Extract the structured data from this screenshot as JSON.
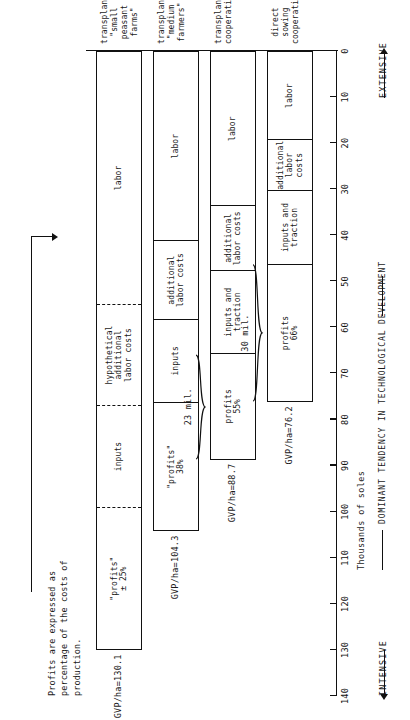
{
  "figure": {
    "note": "Profits are expressed as\npercentage of the costs of\nproduction.",
    "value_axis_title": "Thousands of soles",
    "dominant_tendency_label": "DOMINANT TENDENCY IN TECHNOLOGICAL DEVELOPMENT",
    "intensive_label": "INTENSIVE",
    "extensive_label": "EXTENSIVE"
  },
  "chart_data": {
    "type": "bar",
    "orientation": "horizontal-stacked-rotated",
    "title": "",
    "xlabel": "Thousands of soles",
    "ylabel": "",
    "xlim": [
      0,
      140
    ],
    "grid": false,
    "legend": "none",
    "ticks": [
      140,
      130,
      120,
      110,
      100,
      90,
      80,
      70,
      60,
      50,
      40,
      30,
      20,
      10,
      0
    ],
    "categories": [
      "transplanting\n\"small peasant\nfarms\"",
      "transplanting\n\"medium farmers\"",
      "transplanting\ncooperatives",
      "direct sowing\ncooperatives"
    ],
    "bars": [
      {
        "gvp_label": "GVP/ha=130.1",
        "total": 130.1,
        "category": "transplanting\n\"small peasant\nfarms\"",
        "dashed_dividers": true,
        "segments": [
          {
            "label": "\"profits\"",
            "pct": "± 25%",
            "value": 31.0
          },
          {
            "label": "inputs",
            "pct": "",
            "value": 22.0
          },
          {
            "label": "hypothetical\nadditional\nlabor costs",
            "pct": "",
            "value": 22.0
          },
          {
            "label": "labor",
            "pct": "",
            "value": 55.1
          }
        ]
      },
      {
        "gvp_label": "GVP/ha=104.3",
        "total": 104.3,
        "category": "transplanting\n\"medium farmers\"",
        "dashed_dividers": false,
        "segments": [
          {
            "label": "\"profits\"",
            "pct": "38%",
            "value": 28.0
          },
          {
            "label": "inputs",
            "pct": "",
            "value": 18.0
          },
          {
            "label": "additional\nlabor costs",
            "pct": "",
            "value": 17.0
          },
          {
            "label": "labor",
            "pct": "",
            "value": 41.3
          }
        ]
      },
      {
        "gvp_label": "GVP/ha=88.7",
        "total": 88.7,
        "category": "transplanting\ncooperatives",
        "dashed_dividers": false,
        "brace": "23 mil.",
        "segments": [
          {
            "label": "profits",
            "pct": "55%",
            "value": 23.0
          },
          {
            "label": "inputs and\ntraction",
            "pct": "",
            "value": 18.0
          },
          {
            "label": "additional\nlabor costs",
            "pct": "",
            "value": 14.0
          },
          {
            "label": "labor",
            "pct": "",
            "value": 33.7
          }
        ]
      },
      {
        "gvp_label": "GVP/ha=76.2",
        "total": 76.2,
        "category": "direct sowing\ncooperatives",
        "dashed_dividers": false,
        "brace": "30 mil.",
        "segments": [
          {
            "label": "profits",
            "pct": "66%",
            "value": 30.0
          },
          {
            "label": "inputs and\ntraction",
            "pct": "",
            "value": 16.0
          },
          {
            "label": "additional\nlabor costs",
            "pct": "",
            "value": 11.0
          },
          {
            "label": "labor",
            "pct": "",
            "value": 19.2
          }
        ]
      }
    ]
  }
}
